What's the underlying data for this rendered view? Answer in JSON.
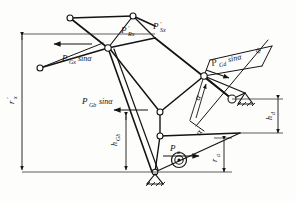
{
  "figure": {
    "background_color": "#fdfdfc",
    "line_color": "#141414",
    "labels": {
      "force_gx": "P",
      "force_gx_sub": "Gx",
      "force_gx_tail": "sinα",
      "force_rx": "P",
      "force_rx_sub": "Rx",
      "force_rx_prime": "′",
      "force_sx": "P",
      "force_sx_sub": "Sx",
      "force_sx_prime": "′",
      "force_gb": "P",
      "force_gb_sub": "Gb",
      "force_gb_tail": "sinα",
      "force_gd": "P",
      "force_gd_sub": "Gd",
      "force_gd_tail": "sinα",
      "force_a": "P",
      "force_a_sub": "a",
      "dim_rx": "r",
      "dim_rx_sub": "x",
      "dim_rx_prime": "′",
      "dim_hgb": "h",
      "dim_hgb_sub": "Gb",
      "dim_hd": "h",
      "dim_hd_sub": "d",
      "dim_ra": "r",
      "dim_ra_sub": "a",
      "angle_alpha_center": "α",
      "angle_alpha_right": "α",
      "angle_alpha_lower": "α"
    },
    "colors": {
      "stroke": "#141414",
      "thin": "#333333",
      "paper": "#fdfdfc"
    }
  }
}
